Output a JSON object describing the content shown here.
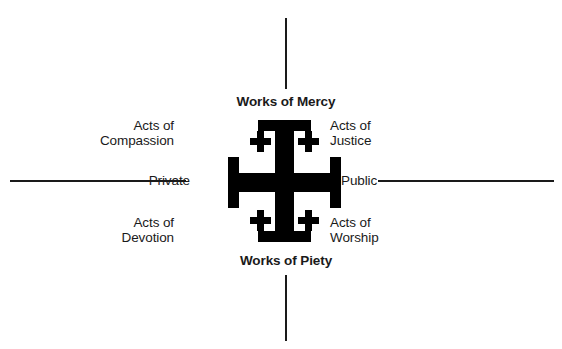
{
  "diagram": {
    "background_color": "#ffffff",
    "ink_color": "#1a1a1a",
    "axes": {
      "vertical": {
        "top_label": "Works of Mercy",
        "bottom_label": "Works of Piety"
      },
      "horizontal": {
        "left_label": "Private",
        "right_label": "Public"
      }
    },
    "quadrant_labels": {
      "top_left": "Acts of\nCompassion",
      "top_right": "Acts of\nJustice",
      "bottom_left": "Acts of\nDevotion",
      "bottom_right": "Acts of\nWorship"
    },
    "center_symbol": {
      "name": "jerusalem-cross",
      "description": "Jerusalem cross: large potent cross with four small Greek crosses in the quadrants",
      "color": "#000000"
    }
  }
}
